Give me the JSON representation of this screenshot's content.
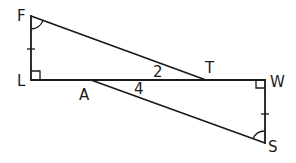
{
  "diagram": {
    "points": {
      "F": {
        "label": "F",
        "x": 31,
        "y": 16
      },
      "L": {
        "label": "L",
        "x": 31,
        "y": 80
      },
      "A": {
        "label": "A",
        "x": 91,
        "y": 80
      },
      "T": {
        "label": "T",
        "x": 206,
        "y": 80
      },
      "W": {
        "label": "W",
        "x": 265,
        "y": 80
      },
      "S": {
        "label": "S",
        "x": 265,
        "y": 143
      }
    },
    "segments": [
      "FL",
      "LW",
      "FT",
      "WS",
      "AS"
    ],
    "angle_labels": {
      "angle2": "2",
      "angle4": "4"
    },
    "markings": {
      "right_angles": [
        "L",
        "W"
      ],
      "tick_marks": [
        "FL",
        "WS"
      ],
      "angle_arcs": [
        "F",
        "S"
      ]
    },
    "colors": {
      "line": "#1a1a1a",
      "background": "#ffffff"
    }
  }
}
